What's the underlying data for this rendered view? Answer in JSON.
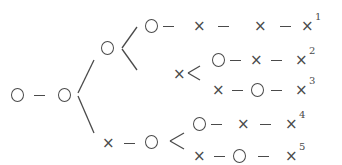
{
  "diagram": {
    "title": "",
    "symbols": {
      "win": "○",
      "loss": "×",
      "connector": "−"
    },
    "color": "#4a4a4a",
    "root": [
      "○",
      "○"
    ],
    "branches": [
      {
        "path": [
          "○",
          "○",
          "○",
          "×",
          "×",
          "×"
        ],
        "label": "1"
      },
      {
        "path": [
          "○",
          "○",
          "×",
          "○",
          "×",
          "×"
        ],
        "label": "2"
      },
      {
        "path": [
          "○",
          "○",
          "×",
          "×",
          "○",
          "×"
        ],
        "label": "3"
      },
      {
        "path": [
          "○",
          "×",
          "○",
          "○",
          "×",
          "×"
        ],
        "label": "4"
      },
      {
        "path": [
          "○",
          "×",
          "○",
          "×",
          "○",
          "×"
        ],
        "label": "5"
      }
    ],
    "superscripts": [
      "1",
      "2",
      "3",
      "4",
      "5"
    ]
  }
}
